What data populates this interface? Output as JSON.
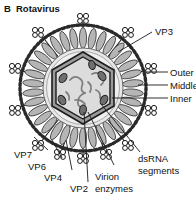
{
  "figure": {
    "panel_letter": "B",
    "title": "Rotavirus",
    "type": "virus-structure-diagram"
  },
  "labels": {
    "vp3": "VP3",
    "outer": "Outer",
    "middle": "Middle",
    "inner": "Inner",
    "vp7": "VP7",
    "vp6": "VP6",
    "vp4": "VP4",
    "vp2": "VP2",
    "virion": "Virion",
    "enzymes": "enzymes",
    "dsrna": "dsRNA",
    "segments": "segments"
  },
  "structures": {
    "outer_capsid": "VP7 outer capsid layer (beaded ring)",
    "middle_capsid": "VP6 middle capsid layer (radial petals)",
    "inner_capsid": "VP2 inner capsid layer (hexagon)",
    "spikes": "VP4 spike proteins",
    "genome": "dsRNA genome segments",
    "enzymes_oval": "Virion enzymes (VP1 / VP3 ovals)"
  },
  "colors": {
    "background": "#ffffff",
    "line": "#1a1a1a",
    "outer_ring": "#2b2b2b",
    "core_fill": "#e8e8e8",
    "petal_fill": "#b5b5b5",
    "hexagon_fill": "#dcdcdc",
    "band_fill": "#9a9a9a",
    "enzyme_fill": "#6f6f6f",
    "rna_stroke": "#7a7a7a",
    "spike_fill": "#ffffff"
  }
}
